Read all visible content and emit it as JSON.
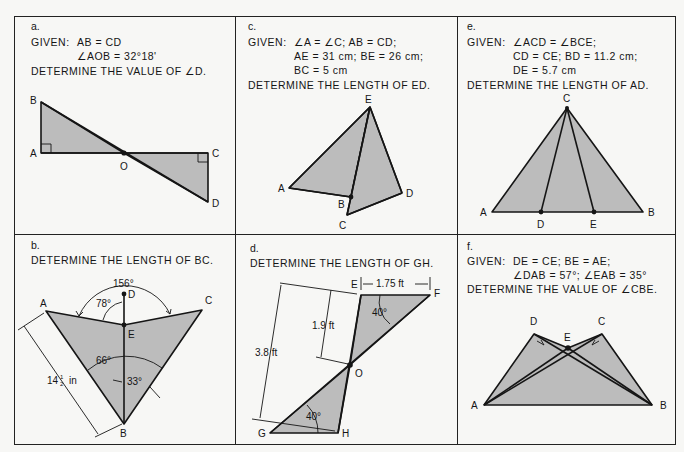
{
  "fill_color": "#bcbcbc",
  "line_color": "#151515",
  "panels": {
    "a": {
      "label": "a.",
      "given_prefix": "GIVEN:",
      "given_lines": [
        "AB = CD",
        "∠AOB = 32°18'"
      ],
      "question": "DETERMINE THE VALUE OF ∠D.",
      "points": {
        "A": "A",
        "B": "B",
        "C": "C",
        "D": "D",
        "O": "O"
      }
    },
    "b": {
      "label": "b.",
      "question": "DETERMINE THE LENGTH OF BC.",
      "points": {
        "A": "A",
        "B": "B",
        "C": "C",
        "D": "D",
        "E": "E"
      },
      "dimensions": {
        "angle_top": "156°",
        "angle_ade": "78°",
        "angle_mid": "66°",
        "angle_low": "33°",
        "length_ab": "14½ in",
        "length_ab_whole": "14",
        "length_ab_frac_num": "1",
        "length_ab_frac_den": "2",
        "length_ab_unit": "in"
      }
    },
    "c": {
      "label": "c.",
      "given_prefix": "GIVEN:",
      "given_lines": [
        "∠A = ∠C; AB = CD;",
        "AE = 31 cm; BE = 26 cm;",
        "BC = 5 cm"
      ],
      "question": "DETERMINE THE LENGTH OF ED.",
      "points": {
        "A": "A",
        "B": "B",
        "C": "C",
        "D": "D",
        "E": "E"
      }
    },
    "d": {
      "label": "d.",
      "question": "DETERMINE THE LENGTH OF GH.",
      "points": {
        "E": "E",
        "F": "F",
        "G": "G",
        "H": "H",
        "O": "O"
      },
      "dimensions": {
        "ef": "1.75 ft",
        "eo": "1.9 ft",
        "total": "3.8 ft",
        "angle_top": "40°",
        "angle_bottom": "40°"
      }
    },
    "e": {
      "label": "e.",
      "given_prefix": "GIVEN:",
      "given_lines": [
        "∠ACD = ∠BCE;",
        "CD = CE; BD = 11.2 cm;",
        "DE = 5.7 cm"
      ],
      "question": "DETERMINE THE LENGTH OF AD.",
      "points": {
        "A": "A",
        "B": "B",
        "C": "C",
        "D": "D",
        "E": "E"
      }
    },
    "f": {
      "label": "f.",
      "given_prefix": "GIVEN:",
      "given_lines": [
        "DE = CE; BE = AE;",
        "∠DAB = 57°; ∠EAB = 35°"
      ],
      "question": "DETERMINE THE VALUE OF ∠CBE.",
      "points": {
        "A": "A",
        "B": "B",
        "C": "C",
        "D": "D",
        "E": "E"
      }
    }
  }
}
